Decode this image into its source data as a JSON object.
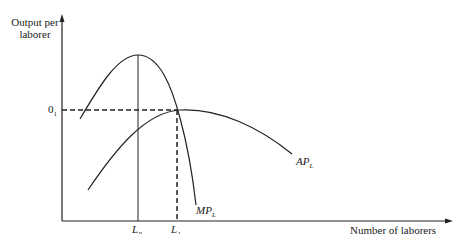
{
  "title_cut": "Table of contents / production",
  "axes": {
    "y_label_line1": "Output per",
    "y_label_line2": "laborer",
    "x_label": "Number of laborers"
  },
  "markers": {
    "o1": "0",
    "o1_sub": "1",
    "l0": "L",
    "l0_sub": "0",
    "l1": "L",
    "l1_sub": "1"
  },
  "curves": {
    "mp": "MP",
    "mp_sub": "L",
    "ap": "AP",
    "ap_sub": "L"
  },
  "colors": {
    "line": "#222222",
    "background": "#ffffff"
  }
}
